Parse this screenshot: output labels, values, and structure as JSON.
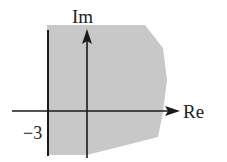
{
  "diagram": {
    "type": "complex-plane-region",
    "axes": {
      "x_label": "Re",
      "y_label": "Im"
    },
    "boundary_line": {
      "label": "−3",
      "value": -3
    },
    "region": {
      "fill": "#c8c8c8",
      "description": "Shaded region to the right of Re = -3"
    },
    "colors": {
      "axis": "#1a1a1a",
      "region": "#c8c8c8"
    }
  }
}
